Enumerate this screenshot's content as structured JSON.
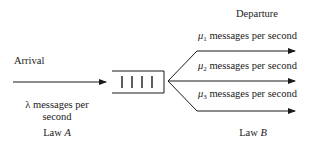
{
  "diagram": {
    "type": "queueing-system",
    "arrival": {
      "title": "Arrival",
      "rate_symbol": "λ",
      "rate_text_line1": "messages per",
      "rate_text_line2": "second",
      "law_prefix": "Law",
      "law_var": "A"
    },
    "queue": {
      "slots": 4
    },
    "departure": {
      "title": "Departure",
      "servers": [
        {
          "symbol": "μ",
          "sub": "1",
          "text": "messages per second"
        },
        {
          "symbol": "μ",
          "sub": "2",
          "text": "messages per second"
        },
        {
          "symbol": "μ",
          "sub": "3",
          "text": "messages per second"
        }
      ],
      "law_prefix": "Law",
      "law_var": "B"
    },
    "colors": {
      "stroke": "#1a1a1a",
      "background": "#ffffff"
    }
  }
}
